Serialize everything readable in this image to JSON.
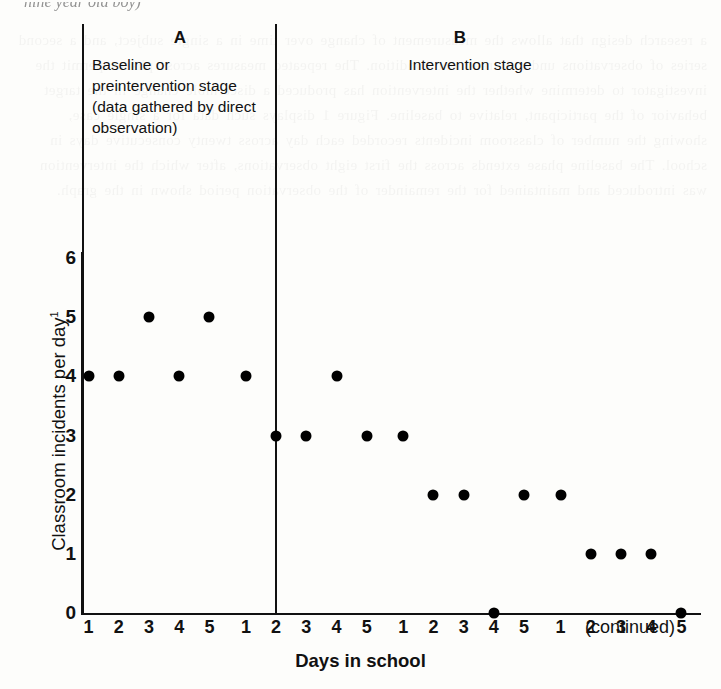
{
  "page": {
    "cut_off_line": "nine year old boy)"
  },
  "figure": {
    "phases": [
      {
        "letter": "A",
        "caption": "Baseline or preintervention stage (data gathered by direct observation)"
      },
      {
        "letter": "B",
        "caption": "Intervention stage"
      }
    ],
    "continued_note": "(continued)"
  },
  "chart_data": {
    "type": "scatter",
    "title": "",
    "xlabel": "Days in school",
    "ylabel": "Classroom incidents per day",
    "ylabel_superscript": "1",
    "ylim": [
      0,
      6
    ],
    "yticks": [
      0,
      1,
      2,
      3,
      4,
      5,
      6
    ],
    "ytick_labels": [
      "0",
      "1",
      "2",
      "3",
      "4",
      "5",
      "6"
    ],
    "grid": false,
    "legend": null,
    "xtick_labels": [
      "1",
      "2",
      "3",
      "4",
      "5",
      "1",
      "2",
      "3",
      "4",
      "5",
      "1",
      "2",
      "3",
      "4",
      "5",
      "1",
      "2",
      "3",
      "4",
      "5"
    ],
    "x_groups": [
      {
        "name": "Week 1",
        "days": [
          "1",
          "2",
          "3",
          "4",
          "5"
        ]
      },
      {
        "name": "Week 2",
        "days": [
          "1",
          "2",
          "3",
          "4",
          "5"
        ]
      },
      {
        "name": "Week 3",
        "days": [
          "1",
          "2",
          "3",
          "4",
          "5"
        ]
      },
      {
        "name": "Week 4",
        "days": [
          "1",
          "2",
          "3",
          "4",
          "5"
        ]
      }
    ],
    "phase_break_after_session": 8,
    "x": [
      1,
      2,
      3,
      4,
      5,
      6,
      7,
      8,
      9,
      10,
      11,
      12,
      13,
      14,
      15,
      16,
      17,
      18,
      19,
      20
    ],
    "values": [
      4,
      4,
      5,
      4,
      5,
      4,
      3,
      3,
      4,
      3,
      3,
      2,
      2,
      0,
      2,
      2,
      1,
      1,
      1,
      0
    ],
    "series": [
      {
        "name": "Classroom incidents per day",
        "phase_A": {
          "sessions": [
            1,
            2,
            3,
            4,
            5,
            6,
            7,
            8
          ],
          "values": [
            4,
            4,
            5,
            4,
            5,
            4,
            3,
            3
          ]
        },
        "phase_B": {
          "sessions": [
            9,
            10,
            11,
            12,
            13,
            14,
            15,
            16,
            17,
            18,
            19,
            20
          ],
          "values": [
            4,
            3,
            3,
            2,
            2,
            0,
            2,
            2,
            1,
            1,
            1,
            0
          ]
        }
      }
    ],
    "annotations": [
      {
        "text": "A",
        "meaning": "Baseline or preintervention stage (data gathered by direct observation)"
      },
      {
        "text": "B",
        "meaning": "Intervention stage"
      },
      {
        "text": "(continued)",
        "position": "right of x-axis"
      }
    ]
  }
}
